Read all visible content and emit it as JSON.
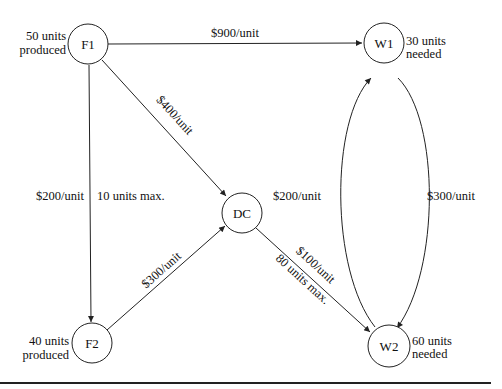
{
  "diagram": {
    "type": "network-flow",
    "nodes": {
      "F1": {
        "label": "F1",
        "note_line1": "50 units",
        "note_line2": "produced"
      },
      "F2": {
        "label": "F2",
        "note_line1": "40 units",
        "note_line2": "produced"
      },
      "DC": {
        "label": "DC"
      },
      "W1": {
        "label": "W1",
        "note_line1": "30 units",
        "note_line2": "needed"
      },
      "W2": {
        "label": "W2",
        "note_line1": "60 units",
        "note_line2": "needed"
      }
    },
    "edges": {
      "F1_W1": {
        "from": "F1",
        "to": "W1",
        "cost": "$900/unit"
      },
      "F1_DC": {
        "from": "F1",
        "to": "DC",
        "cost": "$400/unit"
      },
      "F1_F2": {
        "from": "F1",
        "to": "F2",
        "cost": "$200/unit",
        "capacity": "10 units max."
      },
      "F2_DC": {
        "from": "F2",
        "to": "DC",
        "cost": "$300/unit"
      },
      "DC_W2": {
        "from": "DC",
        "to": "W2",
        "cost": "$100/unit",
        "capacity": "80 units max."
      },
      "W2_W1": {
        "from": "W2",
        "to": "W1",
        "cost": "$200/unit"
      },
      "W1_W2": {
        "from": "W1",
        "to": "W2",
        "cost": "$300/unit"
      }
    }
  }
}
